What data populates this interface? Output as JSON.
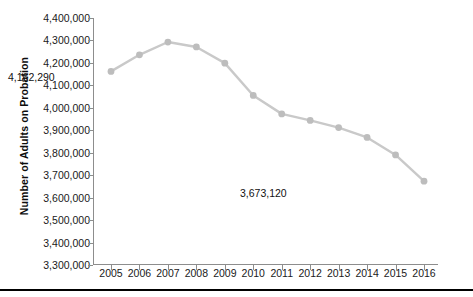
{
  "chart_data": {
    "type": "line",
    "title": "",
    "subtitle": "",
    "xlabel": "",
    "ylabel": "Number of Adults on Probation",
    "categories": [
      "2005",
      "2006",
      "2007",
      "2008",
      "2009",
      "2010",
      "2011",
      "2012",
      "2013",
      "2014",
      "2015",
      "2016"
    ],
    "values": [
      4162290,
      4236000,
      4293000,
      4271000,
      4199000,
      4055000,
      3973000,
      3944000,
      3912000,
      3868000,
      3790000,
      3673120
    ],
    "series": [
      {
        "name": "Number of Adults on Probation",
        "values": [
          4162290,
          4236000,
          4293000,
          4271000,
          4199000,
          4055000,
          3973000,
          3944000,
          3912000,
          3868000,
          3790000,
          3673120
        ]
      }
    ],
    "ylim": [
      3300000,
      4400000
    ],
    "ytick_values": [
      3300000,
      3400000,
      3500000,
      3600000,
      3700000,
      3800000,
      3900000,
      4000000,
      4100000,
      4200000,
      4300000,
      4400000
    ],
    "ytick_labels": [
      "3,300,000",
      "3,400,000",
      "3,500,000",
      "3,600,000",
      "3,700,000",
      "3,800,000",
      "3,900,000",
      "4,000,000",
      "4,100,000",
      "4,200,000",
      "4,300,000",
      "4,400,000"
    ],
    "xtick_labels": [
      "2005",
      "2006",
      "2007",
      "2008",
      "2009",
      "2010",
      "2011",
      "2012",
      "2013",
      "2014",
      "2015",
      "2016"
    ],
    "grid": false,
    "legend": "none",
    "annotations": [
      {
        "label": "4,162,290",
        "category": "2005",
        "value": 4162290
      },
      {
        "label": "3,673,120",
        "category": "2016",
        "value": 3673120
      }
    ],
    "colors": {
      "line": "#c9c9c9",
      "marker": "#bdbdbd",
      "axis": "#8d8d8d",
      "text": "#1a1a1a",
      "rule": "#000000",
      "background": "#ffffff"
    }
  },
  "labels": {
    "first_annotation": "4,162,290",
    "last_annotation": "3,673,120"
  }
}
